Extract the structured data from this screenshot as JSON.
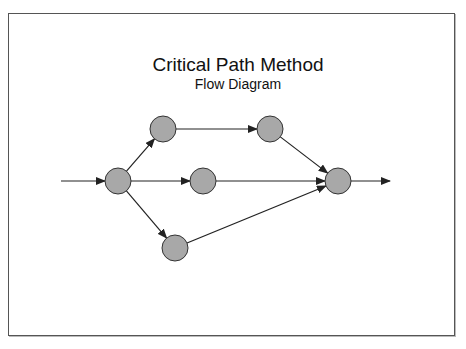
{
  "diagram": {
    "title": "Critical Path Method",
    "subtitle": "Flow Diagram",
    "colors": {
      "node_fill": "#a8a8a8",
      "node_stroke": "#333333",
      "edge": "#222222",
      "frame": "#555555"
    },
    "nodes": [
      {
        "id": "start",
        "x": 118,
        "y": 181
      },
      {
        "id": "top-a",
        "x": 163,
        "y": 129
      },
      {
        "id": "top-b",
        "x": 270,
        "y": 129
      },
      {
        "id": "middle",
        "x": 203,
        "y": 181
      },
      {
        "id": "bottom",
        "x": 175,
        "y": 248
      },
      {
        "id": "end",
        "x": 338,
        "y": 181
      }
    ],
    "edges": [
      {
        "from": "input",
        "to": "start"
      },
      {
        "from": "start",
        "to": "top-a"
      },
      {
        "from": "top-a",
        "to": "top-b"
      },
      {
        "from": "top-b",
        "to": "end"
      },
      {
        "from": "start",
        "to": "middle"
      },
      {
        "from": "middle",
        "to": "end"
      },
      {
        "from": "start",
        "to": "bottom"
      },
      {
        "from": "bottom",
        "to": "end"
      },
      {
        "from": "end",
        "to": "output"
      }
    ]
  }
}
